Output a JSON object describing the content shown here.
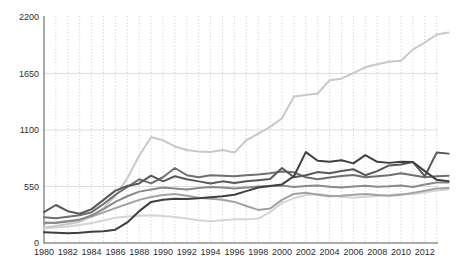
{
  "page": {
    "background": "#ffffff"
  },
  "chart_data": {
    "type": "line",
    "title": "",
    "xlabel": "",
    "ylabel": "",
    "x_years": [
      1980,
      1981,
      1982,
      1983,
      1984,
      1985,
      1986,
      1987,
      1988,
      1989,
      1990,
      1991,
      1992,
      1993,
      1994,
      1995,
      1996,
      1997,
      1998,
      1999,
      2000,
      2001,
      2002,
      2003,
      2004,
      2005,
      2006,
      2007,
      2008,
      2009,
      2010,
      2011,
      2012,
      2013,
      2014
    ],
    "x_tick_labels": [
      "1980",
      "1982",
      "1984",
      "1986",
      "1988",
      "1990",
      "1992",
      "1994",
      "1996",
      "1998",
      "2000",
      "2002",
      "2004",
      "2006",
      "2008",
      "2010",
      "2012"
    ],
    "x_tick_values": [
      1980,
      1982,
      1984,
      1986,
      1988,
      1990,
      1992,
      1994,
      1996,
      1998,
      2000,
      2002,
      2004,
      2006,
      2008,
      2010,
      2012
    ],
    "y_ticks": [
      0,
      550,
      1100,
      1650,
      2200
    ],
    "y_tick_labels": [
      "0",
      "550",
      "1100",
      "1650",
      "2200"
    ],
    "ylim": [
      0,
      2200
    ],
    "grid": {
      "vertical": "dotted-every-year",
      "horizontal": "solid-at-yticks",
      "legend": "none"
    },
    "colors": {
      "axis": "#8f8f8f",
      "grid_vertical": "#c9c9c9",
      "grid_horizontal": "#dedede",
      "tick_label": "#2e2e2e"
    },
    "series": [
      {
        "name": "lightest-flat-line",
        "color": "#d5d5d5",
        "values": [
          140,
          150,
          160,
          175,
          195,
          220,
          245,
          258,
          265,
          270,
          262,
          252,
          238,
          222,
          212,
          222,
          230,
          230,
          238,
          300,
          390,
          435,
          468,
          480,
          462,
          450,
          440,
          450,
          458,
          468,
          478,
          475,
          492,
          510,
          520
        ]
      },
      {
        "name": "light-rising-line",
        "color": "#c6cac6",
        "values": [
          150,
          165,
          185,
          205,
          260,
          340,
          460,
          630,
          850,
          1030,
          1000,
          940,
          905,
          890,
          885,
          905,
          880,
          1000,
          1065,
          1130,
          1215,
          1425,
          1440,
          1455,
          1585,
          1600,
          1655,
          1710,
          1740,
          1765,
          1775,
          1885,
          1950,
          2030,
          2050
        ]
      },
      {
        "name": "medium-light-line",
        "color": "#a2a2a2",
        "values": [
          190,
          200,
          215,
          230,
          258,
          298,
          340,
          380,
          420,
          448,
          468,
          478,
          460,
          440,
          430,
          420,
          400,
          360,
          322,
          335,
          420,
          478,
          490,
          470,
          455,
          460,
          470,
          478,
          468,
          460,
          470,
          488,
          508,
          530,
          535
        ]
      },
      {
        "name": "medium-gray-line",
        "color": "#8a8a8a",
        "values": [
          200,
          195,
          210,
          225,
          270,
          330,
          400,
          455,
          500,
          520,
          540,
          530,
          520,
          535,
          545,
          540,
          530,
          540,
          550,
          555,
          560,
          545,
          555,
          560,
          548,
          540,
          550,
          558,
          548,
          552,
          560,
          545,
          570,
          588,
          590
        ]
      },
      {
        "name": "medium-dark-line",
        "color": "#6f6f6f",
        "values": [
          250,
          240,
          255,
          270,
          300,
          380,
          470,
          545,
          620,
          580,
          640,
          730,
          660,
          640,
          660,
          655,
          650,
          660,
          668,
          678,
          695,
          688,
          640,
          620,
          638,
          652,
          662,
          640,
          650,
          660,
          678,
          660,
          640,
          650,
          655
        ]
      },
      {
        "name": "dark-line",
        "color": "#585858",
        "values": [
          300,
          370,
          310,
          285,
          330,
          420,
          510,
          555,
          580,
          655,
          600,
          650,
          620,
          600,
          580,
          600,
          585,
          600,
          612,
          622,
          730,
          640,
          660,
          690,
          680,
          700,
          718,
          660,
          700,
          755,
          765,
          788,
          650,
          880,
          870
        ]
      },
      {
        "name": "darkest-line",
        "color": "#3f3f3f",
        "values": [
          105,
          100,
          95,
          100,
          110,
          115,
          130,
          200,
          310,
          400,
          420,
          430,
          428,
          435,
          445,
          455,
          470,
          505,
          540,
          555,
          570,
          650,
          885,
          800,
          790,
          805,
          775,
          855,
          790,
          780,
          790,
          788,
          700,
          615,
          600
        ]
      }
    ]
  }
}
